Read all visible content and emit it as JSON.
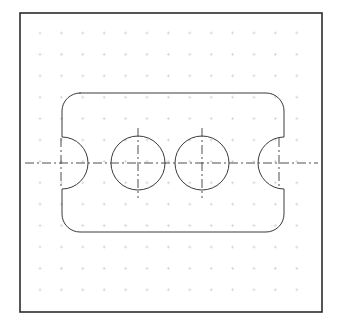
{
  "document": {
    "type": "engineering-drawing",
    "title": "Orthographic plan view of a notched plate with two through holes",
    "background_color": "#ffffff",
    "width": 340,
    "height": 326
  },
  "frame": {
    "name": "drawing-border",
    "x": 20,
    "y": 13,
    "width": 302,
    "height": 299,
    "stroke_color": "#2b2b2b",
    "stroke_width": 1.6,
    "fill": "none"
  },
  "grid": {
    "name": "graph-paper-grid",
    "mark_style": "cross",
    "spacing": 21.4,
    "origin_x": 40,
    "origin_y": 33,
    "columns": 13,
    "rows": 13,
    "mark_size": 3.2,
    "stroke_color": "#c8c6c8",
    "stroke_width": 0.55
  },
  "geometry": {
    "outline": {
      "name": "plate-outline",
      "description": "Rounded rectangle with semicircular notches on left and right edges",
      "left": 62,
      "right": 284,
      "top": 93,
      "bottom": 232,
      "corner_radius": 18,
      "notch_radius": 26,
      "notch_center_y": 163,
      "stroke_color": "#3a3a3a",
      "stroke_width": 1.0,
      "fill": "none"
    },
    "holes": [
      {
        "name": "through-hole-left",
        "cx": 138,
        "cy": 163,
        "r": 27,
        "stroke_color": "#3a3a3a",
        "stroke_width": 1.0
      },
      {
        "name": "through-hole-right",
        "cx": 202,
        "cy": 163,
        "r": 27,
        "stroke_color": "#3a3a3a",
        "stroke_width": 1.0
      }
    ],
    "centerlines": {
      "stroke_color": "#3a3a3a",
      "stroke_width": 0.9,
      "dash_pattern": "9 3 2 3",
      "horizontal_axis": {
        "name": "horizontal-centerline",
        "x1": 25,
        "x2": 318,
        "y": 163
      },
      "verticals": [
        {
          "name": "notch-centerline-left",
          "x": 61,
          "y1": 138,
          "y2": 188
        },
        {
          "name": "hole-centerline-left",
          "x": 138,
          "y1": 128,
          "y2": 198
        },
        {
          "name": "hole-centerline-right",
          "x": 202,
          "y1": 128,
          "y2": 198
        },
        {
          "name": "notch-centerline-right",
          "x": 279,
          "y1": 138,
          "y2": 188
        }
      ]
    }
  },
  "chart_data": {
    "type": "table",
    "xlabel": "",
    "ylabel": "",
    "grid": true,
    "legend": "none",
    "categories": [
      "left_edge",
      "right_edge",
      "top_edge",
      "bottom_edge",
      "corner_radius",
      "notch_radius",
      "hole_radius",
      "hole_left_cx",
      "hole_right_cx",
      "axis_y"
    ],
    "values": [
      62,
      284,
      93,
      232,
      18,
      26,
      27,
      138,
      202,
      163
    ]
  }
}
